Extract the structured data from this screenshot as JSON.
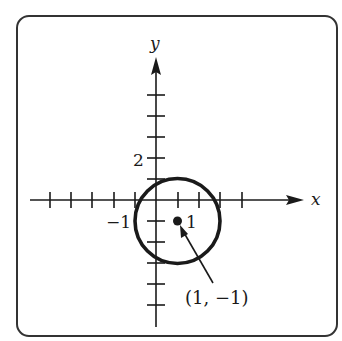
{
  "figure": {
    "x_axis_label": "x",
    "y_axis_label": "y",
    "tick_label_y_2": "2",
    "tick_label_x_neg1": "−1",
    "tick_label_x_1": "1",
    "center_annotation": "(1, −1)"
  },
  "graph": {
    "type": "circle",
    "center": [
      1,
      -1
    ],
    "radius": 2,
    "x_ticks": [
      -6,
      -5,
      -4,
      -3,
      -2,
      -1,
      1,
      2,
      3,
      4
    ],
    "y_ticks": [
      -5,
      -4,
      -3,
      -2,
      -1,
      1,
      2,
      3,
      4,
      5
    ],
    "colors": {
      "stroke": "#1a1a1a",
      "frame": "#333333"
    }
  }
}
